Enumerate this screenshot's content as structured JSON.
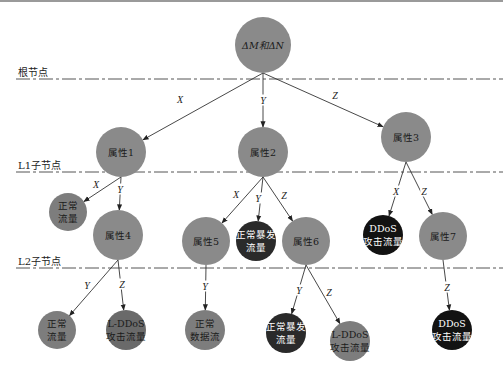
{
  "colors": {
    "attribute_node": "#8a8a8a",
    "normal_node": "#7d7d7d",
    "ldos_node": "#6a6a6a",
    "burst_node": "#2a2a2a",
    "ddos_node": "#121212",
    "line": "#333333"
  },
  "levels": [
    {
      "label": "根节点",
      "y": 79
    },
    {
      "label": "L1子节点",
      "y": 172
    },
    {
      "label": "L2子节点",
      "y": 268
    }
  ],
  "nodes": [
    {
      "id": "root",
      "lines": [
        "ΔM和ΔN"
      ],
      "x": 263,
      "y": 45,
      "r": 28,
      "type": "attribute_node"
    },
    {
      "id": "attr1",
      "lines": [
        "属性1"
      ],
      "x": 121,
      "y": 152,
      "r": 25,
      "type": "attribute_node"
    },
    {
      "id": "attr2",
      "lines": [
        "属性2"
      ],
      "x": 263,
      "y": 152,
      "r": 25,
      "type": "attribute_node"
    },
    {
      "id": "attr3",
      "lines": [
        "属性3"
      ],
      "x": 406,
      "y": 137,
      "r": 25,
      "type": "attribute_node"
    },
    {
      "id": "normal1",
      "lines": [
        "正常",
        "流量"
      ],
      "x": 68,
      "y": 212,
      "r": 19,
      "type": "normal_node"
    },
    {
      "id": "attr4",
      "lines": [
        "属性4"
      ],
      "x": 118,
      "y": 235,
      "r": 25,
      "type": "attribute_node"
    },
    {
      "id": "attr5",
      "lines": [
        "属性5"
      ],
      "x": 206,
      "y": 241,
      "r": 24,
      "type": "attribute_node"
    },
    {
      "id": "burst1",
      "lines": [
        "正常暴发",
        "流量"
      ],
      "x": 256,
      "y": 241,
      "r": 20,
      "type": "burst_node"
    },
    {
      "id": "attr6",
      "lines": [
        "属性6"
      ],
      "x": 306,
      "y": 241,
      "r": 24,
      "type": "attribute_node"
    },
    {
      "id": "ddos1",
      "lines": [
        "DDoS",
        "攻击流量"
      ],
      "x": 383,
      "y": 235,
      "r": 20,
      "type": "ddos_node"
    },
    {
      "id": "attr7",
      "lines": [
        "属性7"
      ],
      "x": 443,
      "y": 236,
      "r": 24,
      "type": "attribute_node"
    },
    {
      "id": "normal2",
      "lines": [
        "正常",
        "流量"
      ],
      "x": 57,
      "y": 330,
      "r": 19,
      "type": "normal_node"
    },
    {
      "id": "lddos1",
      "lines": [
        "L-DDoS",
        "攻击流量"
      ],
      "x": 126,
      "y": 330,
      "r": 20,
      "type": "ldos_node"
    },
    {
      "id": "normaldata",
      "lines": [
        "正常",
        "数据流"
      ],
      "x": 205,
      "y": 330,
      "r": 20,
      "type": "normal_node"
    },
    {
      "id": "burst2",
      "lines": [
        "正常暴发",
        "流量"
      ],
      "x": 286,
      "y": 333,
      "r": 20,
      "type": "burst_node"
    },
    {
      "id": "lddos2",
      "lines": [
        "L-DDoS",
        "攻击流量"
      ],
      "x": 350,
      "y": 341,
      "r": 20,
      "type": "normal_node"
    },
    {
      "id": "ddos2",
      "lines": [
        "DDoS",
        "攻击流量"
      ],
      "x": 452,
      "y": 330,
      "r": 20,
      "type": "ddos_node"
    }
  ],
  "edges": [
    {
      "from": "root",
      "to": "attr1",
      "label": "X",
      "lx": 180,
      "ly": 99
    },
    {
      "from": "root",
      "to": "attr2",
      "label": "Y",
      "lx": 263,
      "ly": 100
    },
    {
      "from": "root",
      "to": "attr3",
      "label": "Z",
      "lx": 335,
      "ly": 95
    },
    {
      "from": "attr1",
      "to": "normal1",
      "label": "X",
      "lx": 96,
      "ly": 184
    },
    {
      "from": "attr1",
      "to": "attr4",
      "label": "Y",
      "lx": 120,
      "ly": 189
    },
    {
      "from": "attr2",
      "to": "attr5",
      "label": "X",
      "lx": 236,
      "ly": 194
    },
    {
      "from": "attr2",
      "to": "burst1",
      "label": "Y",
      "lx": 258,
      "ly": 198
    },
    {
      "from": "attr2",
      "to": "attr6",
      "label": "Z",
      "lx": 284,
      "ly": 195
    },
    {
      "from": "attr3",
      "to": "ddos1",
      "label": "X",
      "lx": 396,
      "ly": 191
    },
    {
      "from": "attr3",
      "to": "attr7",
      "label": "Z",
      "lx": 424,
      "ly": 191
    },
    {
      "from": "attr4",
      "to": "normal2",
      "label": "Y",
      "lx": 87,
      "ly": 285
    },
    {
      "from": "attr4",
      "to": "lddos1",
      "label": "Z",
      "lx": 122,
      "ly": 284
    },
    {
      "from": "attr5",
      "to": "normaldata",
      "label": "Y",
      "lx": 205,
      "ly": 286
    },
    {
      "from": "attr6",
      "to": "burst2",
      "label": "Y",
      "lx": 299,
      "ly": 290
    },
    {
      "from": "attr6",
      "to": "lddos2",
      "label": "Z",
      "lx": 329,
      "ly": 292
    },
    {
      "from": "attr7",
      "to": "ddos2",
      "label": "Z",
      "lx": 447,
      "ly": 287
    }
  ]
}
